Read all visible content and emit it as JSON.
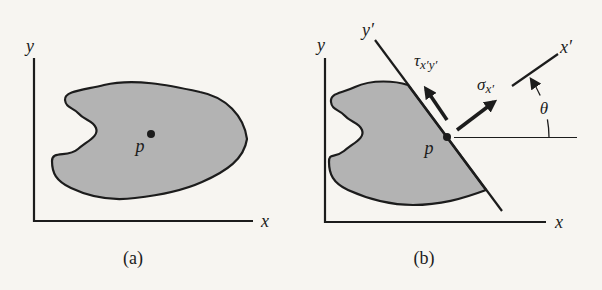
{
  "figure": {
    "panel_a": {
      "caption": "(a)",
      "y_axis_label": "y",
      "x_axis_label": "x",
      "point_label": "p"
    },
    "panel_b": {
      "caption": "(b)",
      "y_axis_label": "y",
      "x_axis_label": "x",
      "y_prime_axis_label": "y′",
      "x_prime_axis_label": "x′",
      "point_label": "p",
      "angle_label": "θ",
      "normal_stress_label": {
        "base": "σ",
        "sub": "x′"
      },
      "shear_stress_label": {
        "base": "τ",
        "sub": "x′y′"
      }
    }
  },
  "colors": {
    "paper": "#f7f5f1",
    "ink": "#1c1c1c",
    "body_fill": "#b3b3b3"
  }
}
